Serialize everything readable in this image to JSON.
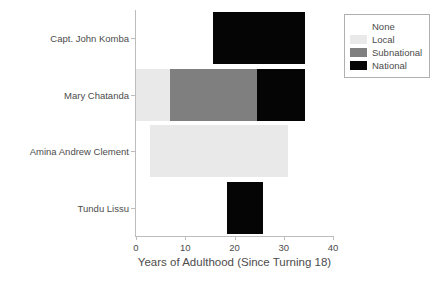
{
  "chart_data": {
    "type": "bar",
    "orientation": "horizontal",
    "stacked": true,
    "title": "",
    "xlabel": "Years of Adulthood (Since Turning 18)",
    "ylabel": "",
    "xlim": [
      0,
      40
    ],
    "xticks": [
      0,
      10,
      20,
      30,
      40
    ],
    "xtick_labels": [
      "0",
      "10",
      "20",
      "30",
      "40"
    ],
    "grid": false,
    "legend_position": "upper right",
    "categories": [
      "Capt. John Komba",
      "Mary Chatanda",
      "Amina Andrew Clement",
      "Tundu Lissu"
    ],
    "series": [
      {
        "name": "None",
        "color": "#ffffff",
        "values": [
          15.6,
          0.0,
          2.8,
          18.5
        ]
      },
      {
        "name": "Local",
        "color": "#e9e9e9",
        "values": [
          0.0,
          6.9,
          28.0,
          0.0
        ]
      },
      {
        "name": "Subnational",
        "color": "#7f7f7f",
        "values": [
          0.0,
          17.6,
          0.0,
          0.0
        ]
      },
      {
        "name": "National",
        "color": "#050505",
        "values": [
          18.7,
          9.8,
          0.0,
          7.2
        ]
      }
    ],
    "bar_totals": [
      34.3,
      34.3,
      30.8,
      25.7
    ]
  },
  "legend": {
    "items": [
      {
        "label": "None",
        "color": "#ffffff"
      },
      {
        "label": "Local",
        "color": "#e9e9e9"
      },
      {
        "label": "Subnational",
        "color": "#7f7f7f"
      },
      {
        "label": "National",
        "color": "#050505"
      }
    ]
  },
  "axis": {
    "x_label": "Years of Adulthood (Since Turning 18)"
  }
}
